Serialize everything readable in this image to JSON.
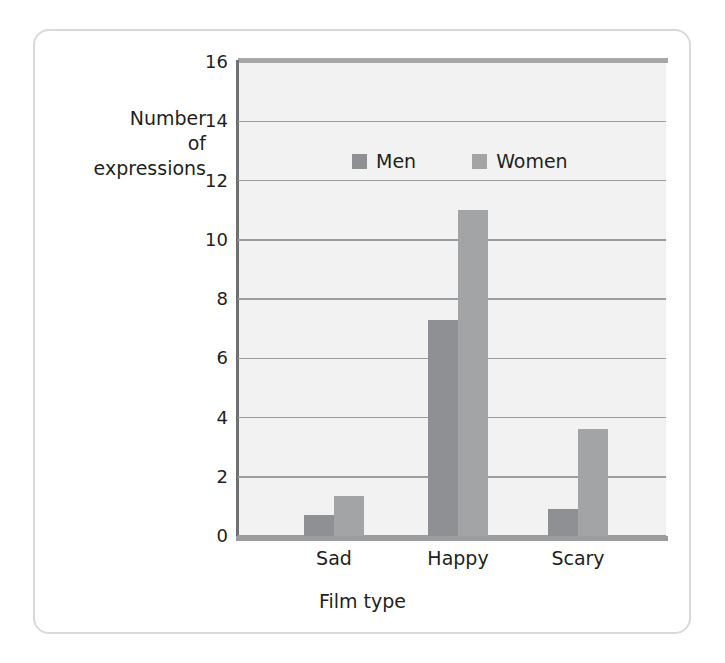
{
  "figure": {
    "frame_border_color": "#d8d9da",
    "plot_background": "#f2f2f2",
    "gridline_color": "#9b9d9f",
    "axis_color": "#6e7072"
  },
  "axes": {
    "y_title": "Number\nof\nexpressions",
    "x_title": "Film type",
    "y_ticks": [
      "0",
      "2",
      "4",
      "6",
      "8",
      "10",
      "12",
      "14",
      "16"
    ],
    "x_ticks": [
      "Sad",
      "Happy",
      "Scary"
    ]
  },
  "legend": {
    "entries": [
      {
        "label": "Men",
        "color": "#8e9093",
        "swatch": "square-swatch-icon"
      },
      {
        "label": "Women",
        "color": "#a2a4a6",
        "swatch": "square-swatch-icon"
      }
    ]
  },
  "chart_data": {
    "type": "bar",
    "title": "",
    "subtitle": "",
    "xlabel": "Film type",
    "ylabel": "Number of expressions",
    "categories": [
      "Sad",
      "Happy",
      "Scary"
    ],
    "series": [
      {
        "name": "Men",
        "color": "#8e9093",
        "values": [
          0.7,
          7.3,
          0.9
        ]
      },
      {
        "name": "Women",
        "color": "#a2a4a6",
        "values": [
          1.35,
          11.0,
          3.6
        ]
      }
    ],
    "ylim": [
      0,
      16
    ],
    "ytick_step": 2,
    "grid": true,
    "grid_axis": "y",
    "legend_position": "inside-upper-center",
    "bar_gap": "grouped-adjacent"
  }
}
